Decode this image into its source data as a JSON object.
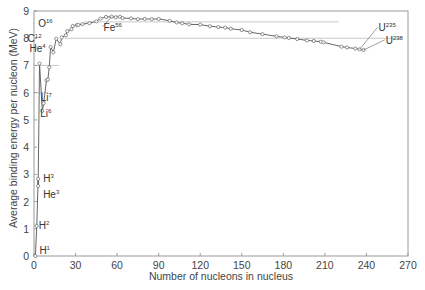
{
  "chart_data": {
    "type": "line",
    "title": "",
    "xlabel": "Number of nucleons in nucleus",
    "ylabel": "Average binding energy per nucleon (MeV)",
    "xlim": [
      0,
      270
    ],
    "ylim": [
      0,
      9
    ],
    "xticks": [
      0,
      30,
      60,
      90,
      120,
      150,
      180,
      210,
      240,
      270
    ],
    "yticks": [
      0,
      1,
      2,
      3,
      4,
      5,
      6,
      7,
      8,
      9
    ],
    "grid": false,
    "legend": null,
    "reference_lines": [
      {
        "y": 8.6,
        "x_from": 36,
        "x_to": 220
      },
      {
        "y": 8.0,
        "x_from": 22,
        "x_to": 265
      },
      {
        "y": 7.0,
        "x_from": 0,
        "x_to": 18
      },
      {
        "y": 6.0,
        "x_from": 0,
        "x_to": 10
      }
    ],
    "series": [
      {
        "name": "Binding energy per nucleon",
        "x": [
          1,
          2,
          3,
          3,
          4,
          6,
          7,
          9,
          10,
          11,
          12,
          14,
          16,
          19,
          20,
          23,
          24,
          27,
          28,
          31,
          32,
          35,
          40,
          45,
          48,
          52,
          56,
          59,
          62,
          64,
          70,
          75,
          80,
          85,
          90,
          98,
          103,
          107,
          112,
          120,
          127,
          133,
          138,
          142,
          150,
          156,
          165,
          175,
          181,
          184,
          190,
          197,
          202,
          207,
          209,
          222,
          226,
          232,
          235,
          238
        ],
        "y": [
          0.0,
          1.11,
          2.83,
          2.57,
          7.07,
          5.33,
          5.61,
          6.46,
          6.48,
          6.93,
          7.68,
          7.48,
          7.98,
          7.78,
          8.03,
          8.11,
          8.26,
          8.33,
          8.45,
          8.48,
          8.49,
          8.52,
          8.55,
          8.62,
          8.72,
          8.78,
          8.79,
          8.77,
          8.79,
          8.74,
          8.73,
          8.7,
          8.71,
          8.7,
          8.71,
          8.64,
          8.58,
          8.55,
          8.51,
          8.5,
          8.44,
          8.41,
          8.39,
          8.35,
          8.3,
          8.22,
          8.15,
          8.07,
          8.03,
          8.01,
          7.97,
          7.92,
          7.9,
          7.87,
          7.85,
          7.69,
          7.66,
          7.62,
          7.59,
          7.57
        ]
      }
    ],
    "annotations": [
      {
        "label": "H",
        "sup": "1",
        "x": 1,
        "y": 0.0
      },
      {
        "label": "H",
        "sup": "2",
        "x": 2,
        "y": 1.11
      },
      {
        "label": "H",
        "sup": "3",
        "x": 3,
        "y": 2.83
      },
      {
        "label": "He",
        "sup": "3",
        "x": 3,
        "y": 2.57
      },
      {
        "label": "He",
        "sup": "4",
        "x": 4,
        "y": 7.07
      },
      {
        "label": "Li",
        "sup": "6",
        "x": 6,
        "y": 5.33
      },
      {
        "label": "Li",
        "sup": "7",
        "x": 7,
        "y": 5.61
      },
      {
        "label": "C",
        "sup": "12",
        "x": 12,
        "y": 7.68
      },
      {
        "label": "O",
        "sup": "16",
        "x": 16,
        "y": 7.98
      },
      {
        "label": "Fe",
        "sup": "56",
        "x": 56,
        "y": 8.79
      },
      {
        "label": "U",
        "sup": "235",
        "x": 235,
        "y": 7.59
      },
      {
        "label": "U",
        "sup": "238",
        "x": 238,
        "y": 7.57
      }
    ]
  }
}
